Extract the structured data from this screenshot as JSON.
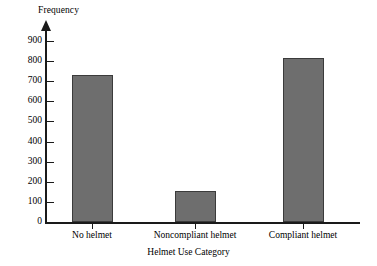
{
  "chart_data": {
    "type": "bar",
    "title": "",
    "categories": [
      "No helmet",
      "Noncompliant helmet",
      "Compliant helmet"
    ],
    "values": [
      730,
      155,
      815
    ],
    "xlabel": "Helmet Use Category",
    "ylabel": "Frequency",
    "ylim": [
      0,
      900
    ],
    "ytick_labels": [
      "0",
      "100",
      "200",
      "300",
      "400",
      "500",
      "600",
      "700",
      "800",
      "900"
    ],
    "ytick_values": [
      0,
      100,
      200,
      300,
      400,
      500,
      600,
      700,
      800,
      900
    ],
    "grid": false,
    "legend": false,
    "bar_color": "#6e6e6e",
    "bar_edge_color": "#3b3b3b",
    "axis_color": "#1a1a1a",
    "background": "#ffffff",
    "y_axis_has_arrow": true
  }
}
